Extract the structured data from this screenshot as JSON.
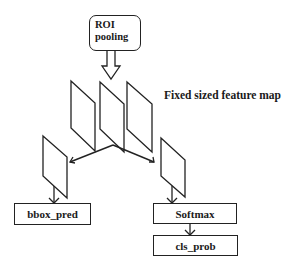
{
  "diagram": {
    "roi_box": {
      "line1": "ROI",
      "line2": "pooling"
    },
    "feature_map_label": "Fixed sized feature map",
    "outputs": {
      "bbox": "bbox_pred",
      "softmax": "Softmax",
      "cls": "cls_prob"
    },
    "colors": {
      "stroke": "#222222",
      "background": "#ffffff"
    }
  }
}
